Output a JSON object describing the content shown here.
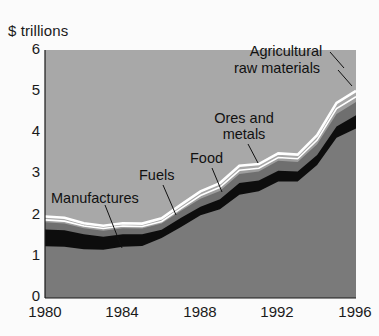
{
  "chart_data": {
    "type": "area",
    "stacked": true,
    "title": "",
    "subtitle": "",
    "xlabel": "",
    "ylabel": "$ trillions",
    "unit_label": "$ trillions",
    "grid": false,
    "legend_position": "inline-annotations",
    "xlim": [
      1980,
      1996
    ],
    "ylim": [
      0,
      6
    ],
    "yticks": [
      "0",
      "1",
      "2",
      "3",
      "4",
      "5",
      "6"
    ],
    "xticks": [
      "1980",
      "1984",
      "1988",
      "1992",
      "1996"
    ],
    "x": [
      1980,
      1981,
      1982,
      1983,
      1984,
      1985,
      1986,
      1987,
      1988,
      1989,
      1990,
      1991,
      1992,
      1993,
      1994,
      1995,
      1996
    ],
    "series": [
      {
        "name": "Manufactures",
        "color": "#7a7a7a",
        "values": [
          1.25,
          1.24,
          1.18,
          1.17,
          1.24,
          1.26,
          1.45,
          1.72,
          2.0,
          2.15,
          2.5,
          2.58,
          2.82,
          2.82,
          3.22,
          3.88,
          4.1
        ]
      },
      {
        "name": "Fuels",
        "color": "#0d0d0d",
        "values": [
          0.41,
          0.4,
          0.36,
          0.31,
          0.3,
          0.28,
          0.2,
          0.22,
          0.21,
          0.24,
          0.28,
          0.26,
          0.26,
          0.24,
          0.24,
          0.27,
          0.32
        ]
      },
      {
        "name": "Food",
        "color": "#6f6f6f",
        "values": [
          0.17,
          0.16,
          0.15,
          0.15,
          0.15,
          0.14,
          0.15,
          0.17,
          0.19,
          0.2,
          0.22,
          0.22,
          0.24,
          0.23,
          0.26,
          0.3,
          0.32
        ]
      },
      {
        "name": "Ores and metals",
        "color": "#9e9e9e",
        "values": [
          0.06,
          0.06,
          0.05,
          0.05,
          0.05,
          0.05,
          0.05,
          0.06,
          0.08,
          0.09,
          0.09,
          0.08,
          0.08,
          0.08,
          0.1,
          0.13,
          0.13
        ]
      },
      {
        "name": "Agricultural raw materials",
        "color": "#a8a8a8",
        "values": [
          0.08,
          0.08,
          0.07,
          0.07,
          0.07,
          0.07,
          0.08,
          0.09,
          0.1,
          0.1,
          0.11,
          0.1,
          0.1,
          0.1,
          0.12,
          0.14,
          0.14
        ]
      }
    ],
    "separator_color": "#ffffff",
    "background_color": "#a8a8a8",
    "annotations": [
      {
        "text": "Manufactures",
        "lines": [
          "Manufactures"
        ]
      },
      {
        "text": "Fuels",
        "lines": [
          "Fuels"
        ]
      },
      {
        "text": "Food",
        "lines": [
          "Food"
        ]
      },
      {
        "text": "Ores and metals",
        "lines": [
          "Ores and",
          "metals"
        ]
      },
      {
        "text": "Agricultural raw materials",
        "lines": [
          "Agricultural",
          "raw materials"
        ]
      }
    ]
  },
  "labels": {
    "unit": "$ trillions",
    "y0": "0",
    "y1": "1",
    "y2": "2",
    "y3": "3",
    "y4": "4",
    "y5": "5",
    "y6": "6",
    "x1980": "1980",
    "x1984": "1984",
    "x1988": "1988",
    "x1992": "1992",
    "x1996": "1996",
    "ann_manufactures": "Manufactures",
    "ann_fuels": "Fuels",
    "ann_food": "Food",
    "ann_ores_1": "Ores and",
    "ann_ores_2": "metals",
    "ann_agri_1": "Agricultural",
    "ann_agri_2": "raw materials"
  }
}
